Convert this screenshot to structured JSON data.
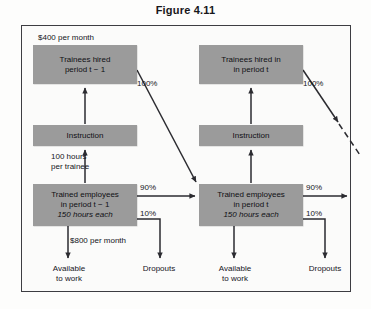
{
  "figure": {
    "title": "Figure 4.11"
  },
  "boxes": {
    "trainees_prev": {
      "line1": "Trainees hired",
      "line2": "period t − 1"
    },
    "trainees_cur": {
      "line1": "Trainees hired in",
      "line2": "in period t"
    },
    "instruction_prev": {
      "line1": "Instruction"
    },
    "instruction_cur": {
      "line1": "Instruction"
    },
    "trained_prev": {
      "line1": "Trained employees",
      "line2": "in period t − 1",
      "line3": "150 hours each"
    },
    "trained_cur": {
      "line1": "Trained employees",
      "line2": "in period t",
      "line3": "150 hours each"
    }
  },
  "annotations": {
    "cost_trainee": "$400 per month",
    "cost_trained": "$800 per month",
    "hours_per_trainee_line1": "100 hours",
    "hours_per_trainee_line2": "per trainee",
    "pct_100_left": "100%",
    "pct_100_right": "100%",
    "pct_90_left": "90%",
    "pct_10_left": "10%",
    "pct_90_right": "90%",
    "pct_10_right": "10%"
  },
  "outputs": {
    "available_prev_line1": "Available",
    "available_prev_line2": "to work",
    "dropouts_prev": "Dropouts",
    "available_cur_line1": "Available",
    "available_cur_line2": "to work",
    "dropouts_cur": "Dropouts"
  },
  "colors": {
    "box_fill": "#9b9b9b",
    "frame_stroke": "#3d3d42",
    "arrow_stroke": "#2b2b30",
    "page_background": "#fdfdfc",
    "text": "#101014"
  }
}
